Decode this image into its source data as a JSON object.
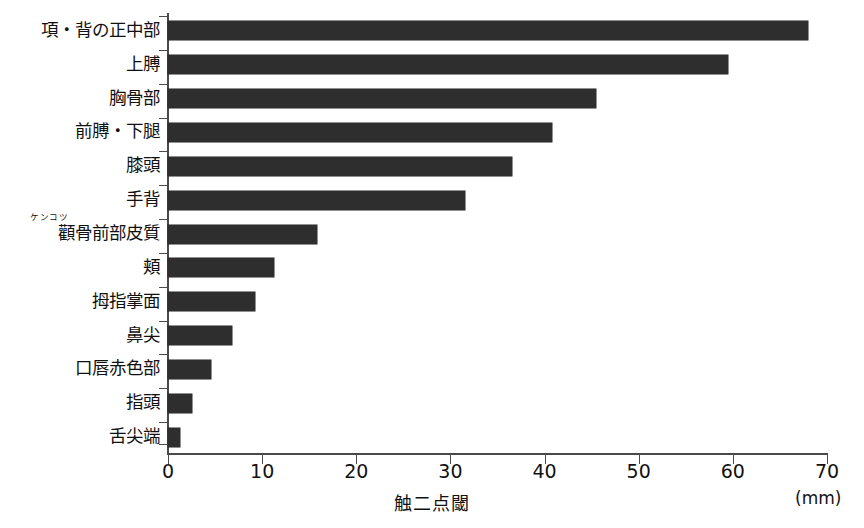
{
  "chart_data": {
    "type": "bar",
    "orientation": "horizontal",
    "title": "",
    "xlabel": "触二点閾",
    "ylabel": "",
    "unit": "(mm)",
    "xlim": [
      0,
      70
    ],
    "xticks": [
      0,
      10,
      20,
      30,
      40,
      50,
      60,
      70
    ],
    "xtick_labels": [
      "0",
      "10",
      "20",
      "30",
      "40",
      "50",
      "60",
      "70"
    ],
    "grid": false,
    "legend": null,
    "bar_color": "#2e2e2e",
    "axis_color": "#4a4a4a",
    "categories": [
      "項・背の正中部",
      "上膊",
      "胸骨部",
      "前膊・下腿",
      "膝頭",
      "手背",
      "顴骨前部皮質",
      "頬",
      "拇指掌面",
      "鼻尖",
      "口唇赤色部",
      "指頭",
      "舌尖端"
    ],
    "category_ruby": {
      "顴骨前部皮質": "ケンコツ"
    },
    "values": [
      68.0,
      59.5,
      45.5,
      40.8,
      36.5,
      31.5,
      15.8,
      11.3,
      9.2,
      6.8,
      4.6,
      2.5,
      1.3
    ]
  }
}
